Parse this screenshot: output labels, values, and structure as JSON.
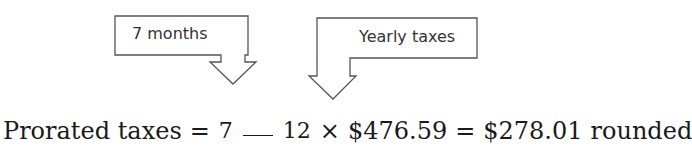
{
  "callouts": [
    {
      "label": "7 months",
      "points_to": "numerator"
    },
    {
      "label": "Yearly taxes",
      "points_to": "yearly_amount"
    }
  ],
  "equation": {
    "lhs": "Prorated taxes",
    "equals1": "=",
    "numerator": "7",
    "denominator": "12",
    "times": "×",
    "yearly_amount": "$476.59",
    "equals2": "=",
    "result": "$278.01",
    "suffix": "rounded"
  },
  "colors": {
    "stroke": "#555555",
    "text": "#1a1a1a"
  }
}
